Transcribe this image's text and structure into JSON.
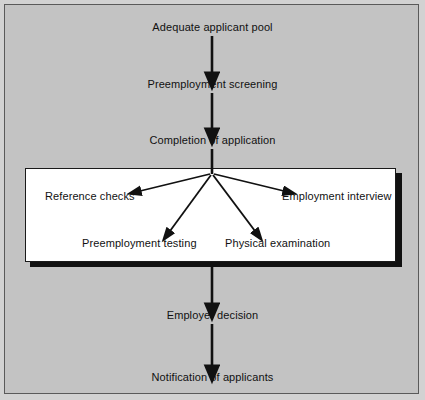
{
  "diagram": {
    "background_color": "#c3c3c3",
    "panel_color": "#ffffff",
    "line_color": "#111111",
    "frame_color": "#5a5a5a"
  },
  "main_flow": [
    {
      "id": "adequate-applicant-pool",
      "label": "Adequate applicant pool",
      "x": 212,
      "y": 28
    },
    {
      "id": "preemployment-screening",
      "label": "Preemployment screening",
      "x": 212,
      "y": 85
    },
    {
      "id": "completion-of-application",
      "label": "Completion of application",
      "x": 212,
      "y": 141
    },
    {
      "id": "employer-decision",
      "label": "Employer decision",
      "x": 212,
      "y": 316
    },
    {
      "id": "notification-of-applicants",
      "label": "Notification of applicants",
      "x": 212,
      "y": 378
    }
  ],
  "subprocess": {
    "id": "screening-methods-panel",
    "items": [
      {
        "id": "reference-checks",
        "label": "Reference checks",
        "x": 88,
        "y": 196
      },
      {
        "id": "employment-interview",
        "label": "Employment interview",
        "x": 339,
        "y": 196
      },
      {
        "id": "preemployment-testing",
        "label": "Preemployment testing",
        "x": 141,
        "y": 243
      },
      {
        "id": "physical-examination",
        "label": "Physical examination",
        "x": 281,
        "y": 243
      }
    ]
  },
  "connectors": {
    "vertical_arrows": [
      {
        "id": "pool-to-screening",
        "from_y": 36,
        "to_y": 77
      },
      {
        "id": "screening-to-completion",
        "from_y": 93,
        "to_y": 133
      },
      {
        "id": "completion-to-panel",
        "from_y": 149,
        "to_y": 173
      },
      {
        "id": "panel-to-decision",
        "from_y": 262,
        "to_y": 308
      },
      {
        "id": "decision-to-notification",
        "from_y": 324,
        "to_y": 370
      }
    ],
    "fan_origin": {
      "x": 212,
      "y": 173
    },
    "fan_arrows": [
      {
        "id": "fan-to-reference-checks",
        "to_x": 136,
        "to_y": 192
      },
      {
        "id": "fan-to-employment-interview",
        "to_x": 288,
        "to_y": 192
      },
      {
        "id": "fan-to-preemployment-testing",
        "to_x": 168,
        "to_y": 234
      },
      {
        "id": "fan-to-physical-examination",
        "to_x": 257,
        "to_y": 234
      }
    ]
  }
}
